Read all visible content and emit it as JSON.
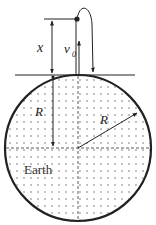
{
  "diagram": {
    "labels": {
      "height": "x",
      "velocity": "v",
      "velocity_subscript": "0",
      "radius_vertical": "R",
      "radius_diagonal": "R",
      "body": "Earth"
    },
    "colors": {
      "stroke": "#222222",
      "dots": "#555555",
      "background": "#ffffff"
    },
    "geometry": {
      "earth_center": [
        78,
        148
      ],
      "earth_radius": 73,
      "surface_line_y": 75,
      "max_height_y": 19
    }
  }
}
